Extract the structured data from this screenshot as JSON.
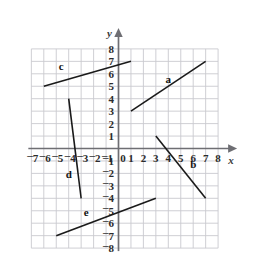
{
  "figure": {
    "type": "coordinate-plane",
    "axis_labels": {
      "x": "x",
      "y": "y"
    },
    "grid": {
      "visible": true,
      "color": "#c9c9cf",
      "spacing_units": 1
    },
    "axis_color": "#6e6e73",
    "line_color": "#1a1a1a",
    "x_axis": {
      "min": -7,
      "max": 8,
      "ticks": [
        "-7",
        "-6",
        "-5",
        "-4",
        "-3",
        "-2",
        "-1",
        "0",
        "1",
        "2",
        "3",
        "4",
        "5",
        "6",
        "7",
        "8"
      ]
    },
    "y_axis": {
      "min": -8,
      "max": 8,
      "ticks": [
        "8",
        "7",
        "6",
        "5",
        "4",
        "3",
        "2",
        "1",
        "0",
        "-1",
        "-2",
        "-3",
        "-4",
        "-5",
        "-6",
        "-7",
        "-8"
      ]
    }
  },
  "chart_data": {
    "type": "line",
    "title": "",
    "xlabel": "x",
    "ylabel": "y",
    "xlim": [
      -7,
      8
    ],
    "ylim": [
      -8,
      8
    ],
    "grid": true,
    "legend": "inline-labels",
    "series": [
      {
        "name": "a",
        "label": "a",
        "x": [
          1,
          7
        ],
        "y": [
          3,
          7
        ],
        "slope": 0.667,
        "label_position": {
          "x": 4.0,
          "y": 5.3
        }
      },
      {
        "name": "b",
        "label": "b",
        "x": [
          3,
          7
        ],
        "y": [
          1,
          -4
        ],
        "slope": -1.25,
        "label_position": {
          "x": 6.0,
          "y": -1.6
        }
      },
      {
        "name": "c",
        "label": "c",
        "x": [
          -6,
          1
        ],
        "y": [
          5,
          7
        ],
        "slope": 0.286,
        "label_position": {
          "x": -4.6,
          "y": 6.3
        }
      },
      {
        "name": "d",
        "label": "d",
        "x": [
          -4,
          -3
        ],
        "y": [
          4,
          -4
        ],
        "slope": -8.0,
        "label_position": {
          "x": -4.0,
          "y": -2.4
        }
      },
      {
        "name": "e",
        "label": "e",
        "x": [
          -5,
          3
        ],
        "y": [
          -7,
          -4
        ],
        "slope": 0.375,
        "label_position": {
          "x": -2.6,
          "y": -5.4
        }
      }
    ]
  }
}
